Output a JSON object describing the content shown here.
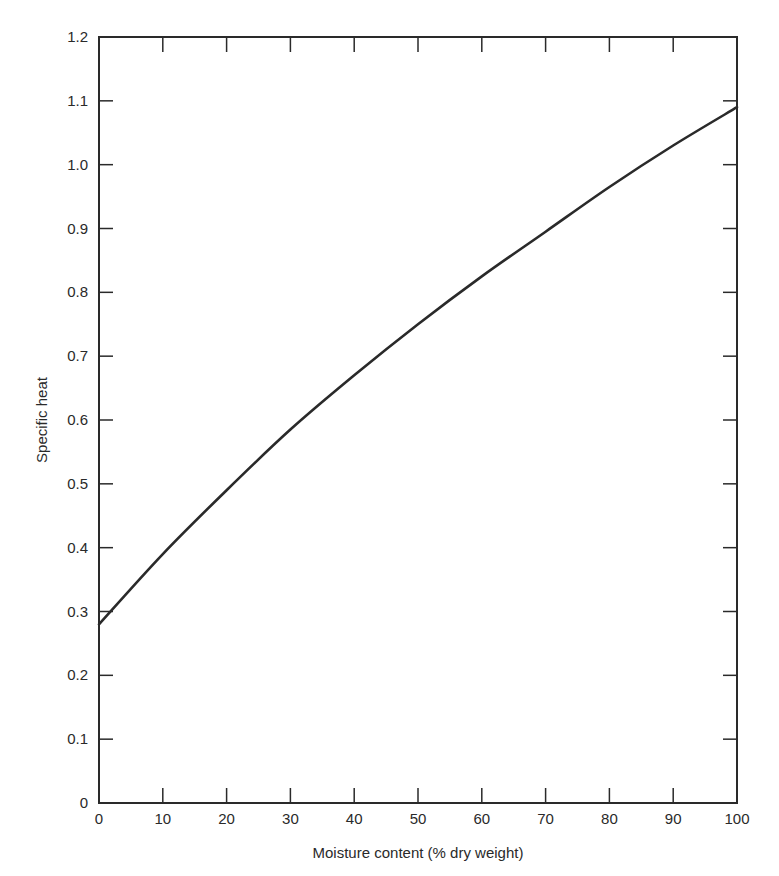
{
  "chart_data": {
    "type": "line",
    "title": "",
    "xlabel": "Moisture content (% dry weight)",
    "ylabel": "Specific heat",
    "xlim": [
      0,
      100
    ],
    "ylim": [
      0,
      1.2
    ],
    "grid": false,
    "legend": null,
    "x_ticks": [
      "0",
      "10",
      "20",
      "30",
      "40",
      "50",
      "60",
      "70",
      "80",
      "90",
      "100"
    ],
    "y_ticks": [
      "0",
      "0.1",
      "0.2",
      "0.3",
      "0.4",
      "0.5",
      "0.6",
      "0.7",
      "0.8",
      "0.9",
      "1.0",
      "1.1",
      "1.2"
    ],
    "series": [
      {
        "name": "Specific heat",
        "x": [
          0,
          10,
          20,
          30,
          40,
          50,
          60,
          70,
          80,
          90,
          100
        ],
        "y": [
          0.28,
          0.39,
          0.49,
          0.585,
          0.67,
          0.75,
          0.825,
          0.895,
          0.965,
          1.03,
          1.09
        ]
      }
    ],
    "colors": {
      "line": "#2a2a2a",
      "axis": "#2a2a2a",
      "background": "#ffffff"
    }
  }
}
